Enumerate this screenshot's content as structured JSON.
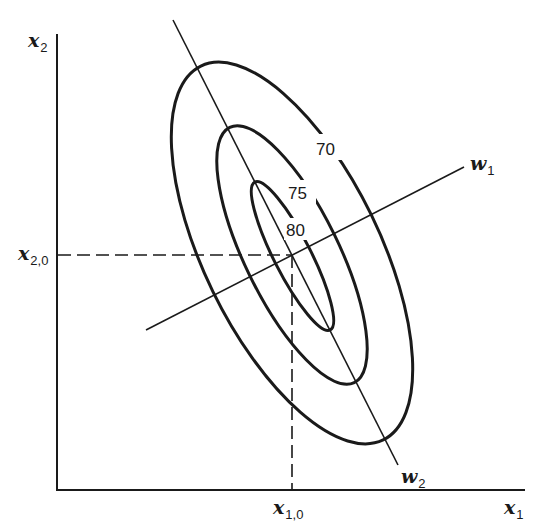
{
  "diagram": {
    "type": "contour-plot",
    "axes": {
      "x": {
        "label": "x",
        "subscript": "1"
      },
      "y": {
        "label": "x",
        "subscript": "2"
      }
    },
    "optimum_point": {
      "x_label": {
        "label": "x",
        "subscript": "1,0"
      },
      "y_label": {
        "label": "x",
        "subscript": "2,0"
      }
    },
    "principal_axes": [
      {
        "label": "w",
        "subscript": "1"
      },
      {
        "label": "w",
        "subscript": "2"
      }
    ],
    "contours": [
      {
        "level": "70"
      },
      {
        "level": "75"
      },
      {
        "level": "80"
      }
    ],
    "colors": {
      "ink": "#1a1a1a",
      "background": "#ffffff"
    }
  }
}
